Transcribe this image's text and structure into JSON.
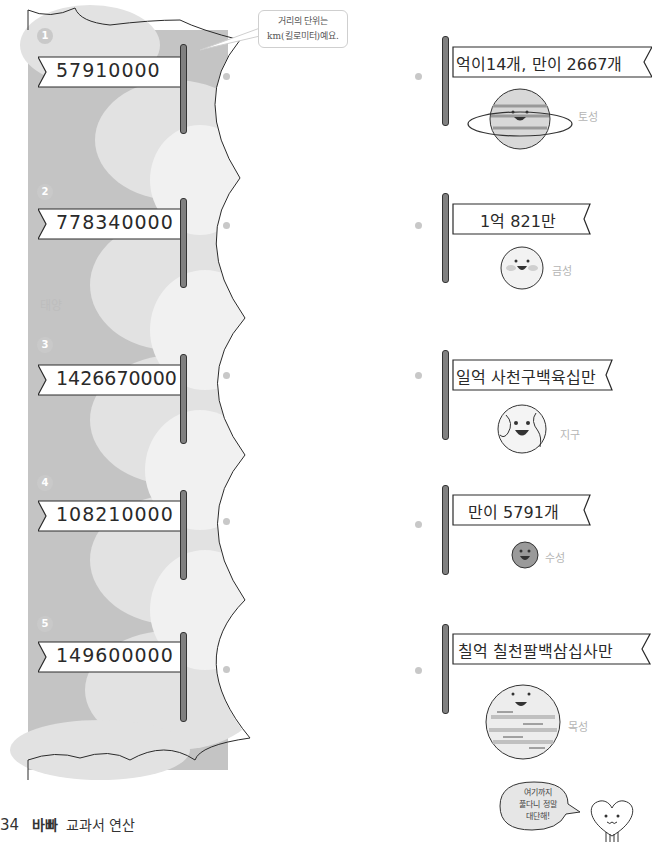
{
  "callout": {
    "line1": "거리의 단위는",
    "line2": "km(킬로미터)예요."
  },
  "sun": {
    "label": "태양"
  },
  "left_items": [
    {
      "number": "1",
      "value": "57910000"
    },
    {
      "number": "2",
      "value": "778340000"
    },
    {
      "number": "3",
      "value": "1426670000"
    },
    {
      "number": "4",
      "value": "108210000"
    },
    {
      "number": "5",
      "value": "149600000"
    }
  ],
  "right_items": [
    {
      "value": "억이14개, 만이 2667개",
      "planet": "토성",
      "planet_icon": "saturn-icon"
    },
    {
      "value": "1억 821만",
      "planet": "금성",
      "planet_icon": "venus-icon"
    },
    {
      "value": "일억 사천구백육십만",
      "planet": "지구",
      "planet_icon": "earth-icon"
    },
    {
      "value": "만이 5791개",
      "planet": "수성",
      "planet_icon": "mercury-icon"
    },
    {
      "value": "칠억 칠천팔백삼십사만",
      "planet": "목성",
      "planet_icon": "jupiter-icon"
    }
  ],
  "footer": {
    "page_number": "34",
    "brand": "바빠",
    "title": "교과서 연산"
  },
  "cheer": {
    "line1": "여기까지",
    "line2": "풀다니 정말",
    "line3": "대단해!"
  },
  "colors": {
    "sun_gray": "#c4c4c4",
    "cloud_light": "#e4e4e4",
    "pole": "#808080",
    "dot": "#c8c8c8"
  }
}
